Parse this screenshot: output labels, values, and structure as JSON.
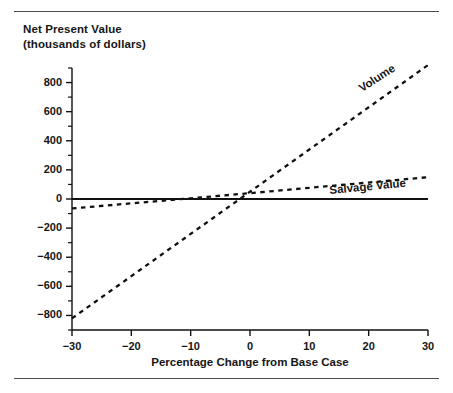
{
  "figure": {
    "width": 453,
    "height": 393,
    "background": "#ffffff",
    "rule_color": "#4d4d4d",
    "line_color": "#111111"
  },
  "chart_data": {
    "type": "line",
    "title": "",
    "ylabel_line1": "Net Present Value",
    "ylabel_line2": "(thousands of dollars)",
    "xlabel": "Percentage Change from Base Case",
    "xlim": [
      -30,
      30
    ],
    "ylim": [
      -900,
      900
    ],
    "grid": false,
    "legend": "inline-labels",
    "xticks": [
      -30,
      -20,
      -10,
      0,
      10,
      20,
      30
    ],
    "xtick_labels": [
      "−30",
      "−20",
      "−10",
      "0",
      "10",
      "20",
      "30"
    ],
    "yticks": [
      -800,
      -600,
      -400,
      -200,
      0,
      200,
      400,
      600,
      800
    ],
    "ytick_labels": [
      "−800",
      "−600",
      "−400",
      "−200",
      "0",
      "200",
      "400",
      "600",
      "800"
    ],
    "yminor_ticks": [
      -900,
      -700,
      -500,
      -300,
      -100,
      100,
      300,
      500,
      700,
      900
    ],
    "x": [
      -30,
      -20,
      -10,
      0,
      10,
      20,
      30
    ],
    "series": [
      {
        "name": "Volume",
        "style": "dashed",
        "values": [
          -820,
          -530,
          -240,
          50,
          340,
          630,
          920
        ]
      },
      {
        "name": "Salvage Value",
        "style": "dashed",
        "values": [
          -65,
          -30,
          5,
          40,
          77,
          113,
          150
        ]
      },
      {
        "name": "Zero Reference",
        "style": "solid",
        "values": [
          0,
          0,
          0,
          0,
          0,
          0,
          0
        ]
      }
    ],
    "annotations": [
      {
        "text": "Volume",
        "x": 25,
        "y": 800,
        "rotation": -33
      },
      {
        "text": "Salvage Value",
        "x": 17,
        "y": 200,
        "rotation": -5.5
      }
    ]
  }
}
